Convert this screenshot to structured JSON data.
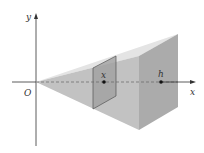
{
  "diagram": {
    "type": "solid-pyramid-cross-section",
    "axes": {
      "x_label": "x",
      "y_label": "y",
      "origin_label": "O"
    },
    "points": {
      "slice_label": "x",
      "end_label": "h"
    },
    "colors": {
      "axis": "#333333",
      "front_face": "#bdbdbd",
      "top_face": "#e2e2e2",
      "right_face": "#a9a9a9",
      "slice": "#9a9a9a",
      "slice_edge": "#555555",
      "dashed": "#666666"
    }
  }
}
